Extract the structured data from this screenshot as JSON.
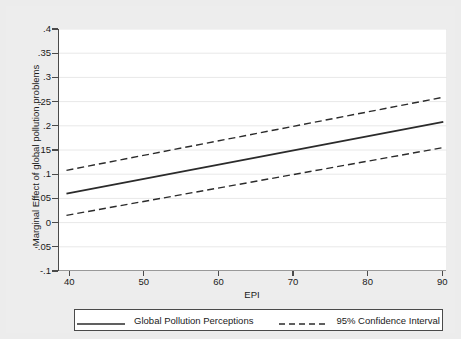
{
  "chart_data": {
    "type": "line",
    "title": "",
    "xlabel": "EPI",
    "ylabel": "Marginal Effect of global pollution problems",
    "xlim": [
      38.5,
      90.5
    ],
    "ylim": [
      -0.1,
      0.4
    ],
    "grid": true,
    "grid_axis": "y",
    "legend_position": "below",
    "xticks": [
      40,
      50,
      60,
      70,
      80,
      90
    ],
    "xtick_labels": [
      "40",
      "50",
      "60",
      "70",
      "80",
      "90"
    ],
    "yticks": [
      -0.1,
      -0.05,
      0,
      0.05,
      0.1,
      0.15,
      0.2,
      0.25,
      0.3,
      0.35,
      0.4
    ],
    "ytick_labels": [
      "-.1",
      "-.05",
      "0",
      ".05",
      ".1",
      ".15",
      ".2",
      ".25",
      ".3",
      ".35",
      ".4"
    ],
    "x": [
      39.5,
      90
    ],
    "series": [
      {
        "name": "Global Pollution Perceptions",
        "style": "solid",
        "color": "#2b2b2b",
        "values": [
          0.06,
          0.208
        ]
      },
      {
        "name": "95% Confidence Interval Upper",
        "style": "dashed",
        "color": "#2b2b2b",
        "values": [
          0.108,
          0.259
        ]
      },
      {
        "name": "95% Confidence Interval Lower",
        "style": "dashed",
        "color": "#2b2b2b",
        "values": [
          0.015,
          0.155
        ]
      }
    ]
  },
  "legend": {
    "entries": [
      {
        "label": "Global Pollution Perceptions",
        "style": "solid"
      },
      {
        "label": "95% Confidence Interval",
        "style": "dashed"
      }
    ]
  },
  "colors": {
    "figure_background": "#ececec",
    "plot_background": "#ffffff",
    "axis": "#4a4a4a",
    "line": "#2b2b2b",
    "grid": "#e8e8e8"
  }
}
